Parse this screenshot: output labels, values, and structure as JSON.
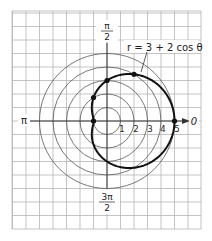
{
  "figure": {
    "equation_label": "r = 3 + 2 cos θ",
    "axis_labels": {
      "zero": "0",
      "pi": "π",
      "half_pi_num": "π",
      "half_pi_den": "2",
      "three_half_pi_num": "3π",
      "three_half_pi_den": "2"
    },
    "radial_ticks": [
      "1",
      "2",
      "3",
      "4",
      "5"
    ],
    "colors": {
      "grid": "#b5b5b5",
      "circles": "#555555",
      "curve": "#111111",
      "axes": "#333333"
    }
  },
  "chart_data": {
    "type": "polar",
    "title": "",
    "equation": "r = 3 + 2cos θ",
    "circle_radii": [
      1,
      2,
      3,
      4,
      5
    ],
    "angle_labels": [
      "0",
      "π/2",
      "π",
      "3π/2"
    ],
    "plotted_points": [
      {
        "theta": "0",
        "r": 5
      },
      {
        "theta": "π/3",
        "r": 4
      },
      {
        "theta": "π/2",
        "r": 3
      },
      {
        "theta": "2π/3",
        "r": 2
      },
      {
        "theta": "π",
        "r": 1
      }
    ],
    "grid": true
  }
}
